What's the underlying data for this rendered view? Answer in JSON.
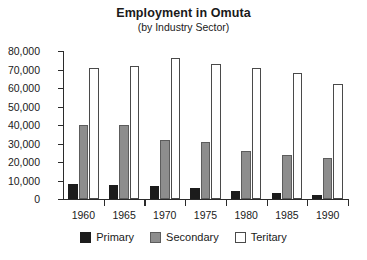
{
  "chart_data": {
    "type": "bar",
    "title": "Employment in Omuta",
    "subtitle": "(by Industry Sector)",
    "xlabel": "",
    "ylabel": "",
    "categories": [
      "1960",
      "1965",
      "1970",
      "1975",
      "1980",
      "1985",
      "1990"
    ],
    "series": [
      {
        "name": "Primary",
        "color": "#1c1c1c",
        "values": [
          8000,
          7500,
          7000,
          6000,
          4500,
          3000,
          2000
        ]
      },
      {
        "name": "Secondary",
        "color": "#8d8d8d",
        "values": [
          40000,
          40000,
          32000,
          31000,
          26000,
          24000,
          22000
        ]
      },
      {
        "name": "Teritary",
        "color": "#d2d2d2",
        "values": [
          71000,
          72000,
          76000,
          73000,
          71000,
          68000,
          62000
        ]
      }
    ],
    "ylim": [
      0,
      80000
    ],
    "ytick_step": 10000,
    "ytick_labels": [
      "80,000",
      "70,000",
      "60,000",
      "50,000",
      "40,000",
      "30,000",
      "20,000",
      "10,000",
      "0"
    ],
    "ytick_values": [
      80000,
      70000,
      60000,
      50000,
      40000,
      30000,
      20000,
      10000,
      0
    ],
    "grid": false,
    "legend_position": "bottom"
  }
}
